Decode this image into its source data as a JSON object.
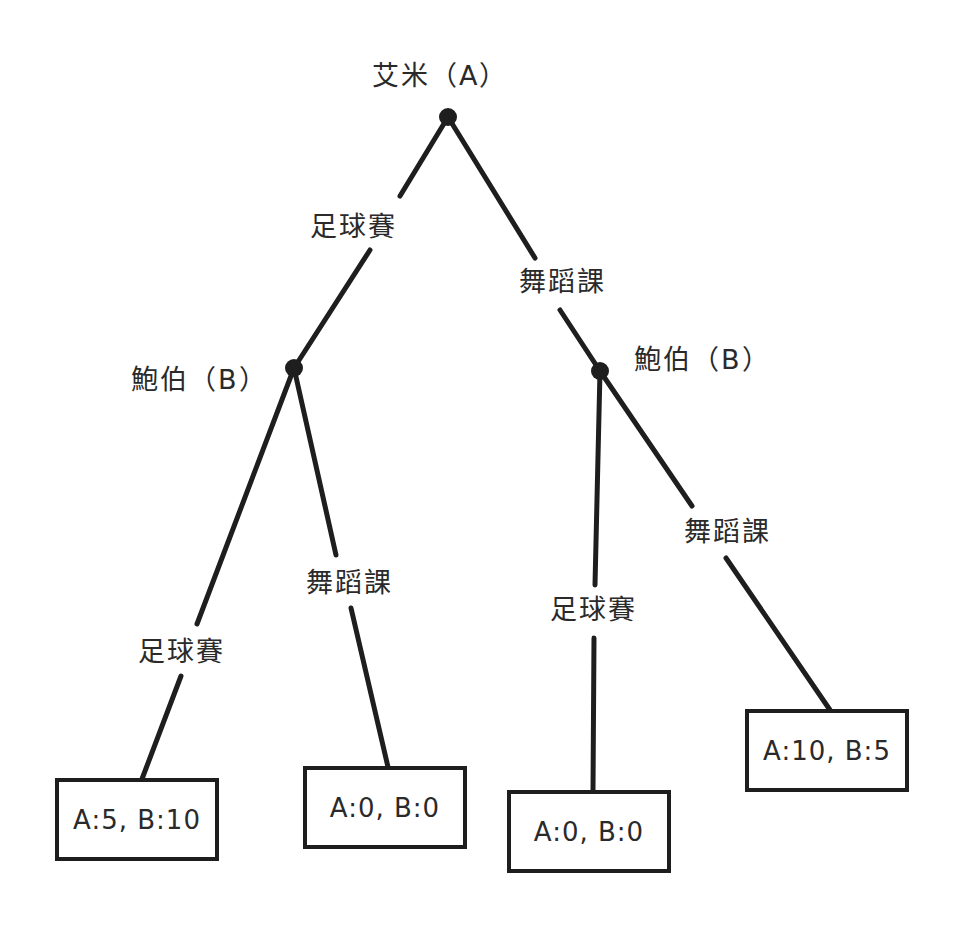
{
  "diagram": {
    "type": "game-tree",
    "root": {
      "player_label": "艾米（A）",
      "x": 448,
      "y": 117
    },
    "level1": {
      "left_edge_label": "足球賽",
      "right_edge_label": "舞蹈課"
    },
    "left_node": {
      "player_label": "鮑伯（B）",
      "x": 294,
      "y": 368,
      "left_edge_label": "足球賽",
      "right_edge_label": "舞蹈課"
    },
    "right_node": {
      "player_label": "鮑伯（B）",
      "x": 600,
      "y": 371,
      "left_edge_label": "足球賽",
      "right_edge_label": "舞蹈課"
    },
    "leaves": [
      {
        "payoff": "A:5, B:10",
        "path": [
          "足球賽",
          "足球賽"
        ]
      },
      {
        "payoff": "A:0, B:0",
        "path": [
          "足球賽",
          "舞蹈課"
        ]
      },
      {
        "payoff": "A:0, B:0",
        "path": [
          "舞蹈課",
          "足球賽"
        ]
      },
      {
        "payoff": "A:10, B:5",
        "path": [
          "舞蹈課",
          "舞蹈課"
        ]
      }
    ],
    "colors": {
      "line": "#1e1e1e",
      "text": "#2a2a2a",
      "background": "#ffffff"
    }
  }
}
